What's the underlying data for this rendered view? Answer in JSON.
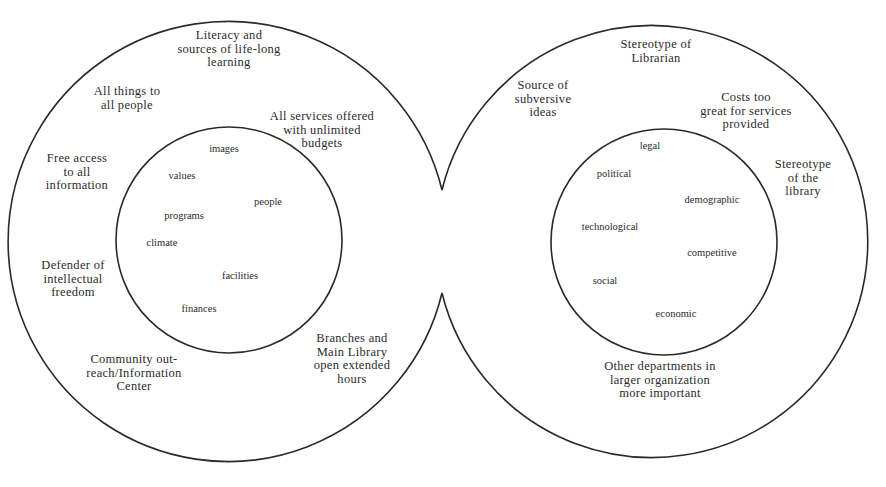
{
  "diagram": {
    "type": "two-interlocking-circles",
    "stroke_color": "#2a2a2a",
    "text_color": "#2b2b2b",
    "left": {
      "outer_labels": [
        {
          "lines": [
            "Literacy and",
            "sources of life-long",
            "learning"
          ],
          "x": 229,
          "y": 39
        },
        {
          "lines": [
            "All things to",
            "all people"
          ],
          "x": 127,
          "y": 95
        },
        {
          "lines": [
            "All services offered",
            "with unlimited",
            "budgets"
          ],
          "x": 322,
          "y": 120
        },
        {
          "lines": [
            "Free access",
            "to all",
            "information"
          ],
          "x": 77,
          "y": 162
        },
        {
          "lines": [
            "Defender of",
            "intellectual",
            "freedom"
          ],
          "x": 73,
          "y": 269
        },
        {
          "lines": [
            "Community out-",
            "reach/Information",
            "Center"
          ],
          "x": 134,
          "y": 363
        },
        {
          "lines": [
            "Branches and",
            "Main Library",
            "open extended",
            "hours"
          ],
          "x": 352,
          "y": 342
        }
      ],
      "inner_labels": [
        {
          "text": "images",
          "x": 224,
          "y": 152
        },
        {
          "text": "values",
          "x": 182,
          "y": 179
        },
        {
          "text": "people",
          "x": 268,
          "y": 205
        },
        {
          "text": "programs",
          "x": 184,
          "y": 219
        },
        {
          "text": "climate",
          "x": 162,
          "y": 246
        },
        {
          "text": "facilities",
          "x": 240,
          "y": 279
        },
        {
          "text": "finances",
          "x": 199,
          "y": 312
        }
      ]
    },
    "right": {
      "outer_labels": [
        {
          "lines": [
            "Stereotype of",
            "Librarian"
          ],
          "x": 656,
          "y": 48
        },
        {
          "lines": [
            "Source of",
            "subversive",
            "ideas"
          ],
          "x": 543,
          "y": 89
        },
        {
          "lines": [
            "Costs too",
            "great for services",
            "provided"
          ],
          "x": 746,
          "y": 101
        },
        {
          "lines": [
            "Stereotype",
            "of the",
            "library"
          ],
          "x": 803,
          "y": 168
        },
        {
          "lines": [
            "Other departments in",
            "larger organization",
            "more important"
          ],
          "x": 660,
          "y": 370
        }
      ],
      "inner_labels": [
        {
          "text": "legal",
          "x": 650,
          "y": 149
        },
        {
          "text": "political",
          "x": 614,
          "y": 177
        },
        {
          "text": "demographic",
          "x": 712,
          "y": 203
        },
        {
          "text": "technological",
          "x": 610,
          "y": 230
        },
        {
          "text": "competitive",
          "x": 712,
          "y": 256
        },
        {
          "text": "social",
          "x": 605,
          "y": 284
        },
        {
          "text": "economic",
          "x": 676,
          "y": 317
        }
      ]
    }
  }
}
